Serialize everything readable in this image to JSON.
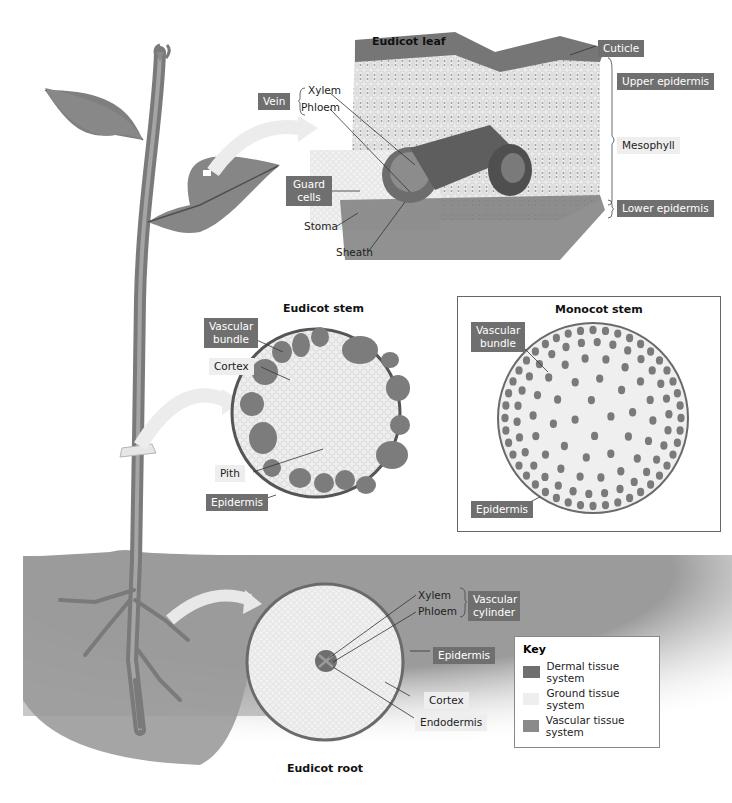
{
  "diagram": {
    "leaf": {
      "title": "Eudicot leaf",
      "labels": {
        "cuticle": "Cuticle",
        "upper_epidermis": "Upper epidermis",
        "mesophyll": "Mesophyll",
        "lower_epidermis": "Lower epidermis",
        "vein": "Vein",
        "xylem": "Xylem",
        "phloem": "Phloem",
        "guard_cells": "Guard cells",
        "stoma": "Stoma",
        "sheath": "Sheath"
      }
    },
    "eudicot_stem": {
      "title": "Eudicot stem",
      "labels": {
        "vascular_bundle": "Vascular bundle",
        "cortex": "Cortex",
        "pith": "Pith",
        "epidermis": "Epidermis"
      }
    },
    "monocot_stem": {
      "title": "Monocot stem",
      "labels": {
        "vascular_bundle": "Vascular bundle",
        "epidermis": "Epidermis"
      }
    },
    "root": {
      "title": "Eudicot root",
      "labels": {
        "xylem": "Xylem",
        "phloem": "Phloem",
        "vascular_cylinder": "Vascular cylinder",
        "epidermis": "Epidermis",
        "cortex": "Cortex",
        "endodermis": "Endodermis"
      }
    },
    "key": {
      "title": "Key",
      "items": [
        {
          "label": "Dermal tissue system",
          "color": "#6f6f6f"
        },
        {
          "label": "Ground tissue system",
          "color": "#eeeeee"
        },
        {
          "label": "Vascular tissue system",
          "color": "#8a8a8a"
        }
      ]
    },
    "colors": {
      "dermal": "#6f6f6f",
      "ground": "#eeeeee",
      "vascular": "#8a8a8a",
      "soil": "#9a9a9a",
      "plant": "#8c8c8c"
    }
  }
}
